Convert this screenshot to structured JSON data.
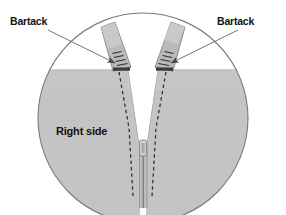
{
  "diagram": {
    "type": "technical-sewing-illustration",
    "shape": "circular-detail-callout",
    "labels": {
      "bartack_left": "Bartack",
      "bartack_right": "Bartack",
      "right_side": "Right side"
    },
    "colors": {
      "background": "#ffffff",
      "fabric_fill": "#c4c4c4",
      "fabric_edge": "#8f8f8f",
      "tab_fill": "#b9b9b9",
      "tab_light": "#d3d3d3",
      "tab_edge": "#8a8a8a",
      "circle_stroke": "#7a7a7a",
      "leader_line": "#6e6e6e",
      "arrow_fill": "#4a4a4a",
      "stitch_dash": "#2b2b2b",
      "zipper_teeth": "#555555",
      "text": "#111111"
    },
    "elements": [
      {
        "name": "detail-circle",
        "shape": "circle",
        "cx": 143,
        "cy": 118,
        "r": 105
      },
      {
        "name": "fabric-panel-left",
        "note": "gray right-side fabric, left of opening"
      },
      {
        "name": "fabric-panel-right",
        "note": "gray right-side fabric, right of opening"
      },
      {
        "name": "v-opening",
        "note": "white V-shaped gap between panels"
      },
      {
        "name": "tab-left",
        "note": "angled strap piece leaning up-left"
      },
      {
        "name": "tab-right",
        "note": "angled strap piece leaning up-right"
      },
      {
        "name": "bartack-left",
        "note": "dense bar of stitches across left tab base"
      },
      {
        "name": "bartack-right",
        "note": "dense bar of stitches across right tab base"
      },
      {
        "name": "stitch-line-left",
        "style": "dashed"
      },
      {
        "name": "stitch-line-right",
        "style": "dashed"
      },
      {
        "name": "zipper-slider",
        "note": "slider body at bottom of V"
      },
      {
        "name": "zipper-tape",
        "note": "vertical zipper below slider"
      },
      {
        "name": "leader-line-left",
        "from": "bartack_left label",
        "to": "bartack-left"
      },
      {
        "name": "leader-line-right",
        "from": "bartack_right label",
        "to": "bartack-right"
      }
    ]
  }
}
